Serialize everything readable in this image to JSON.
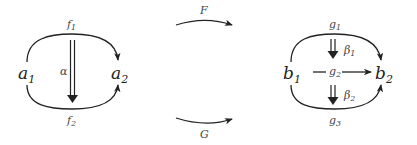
{
  "diagram": {
    "left": {
      "source": {
        "base": "a",
        "sub": "1"
      },
      "target": {
        "base": "a",
        "sub": "2"
      },
      "top_arrow": {
        "base": "f",
        "sub": "1"
      },
      "bottom_arrow": {
        "base": "f",
        "sub": "2"
      },
      "two_cell": "α"
    },
    "middle": {
      "top_functor": "F",
      "bottom_functor": "G"
    },
    "right": {
      "source": {
        "base": "b",
        "sub": "1"
      },
      "target": {
        "base": "b",
        "sub": "2"
      },
      "top_arrow": {
        "base": "g",
        "sub": "1"
      },
      "middle_arrow": {
        "base": "g",
        "sub": "2"
      },
      "bottom_arrow": {
        "base": "g",
        "sub": "3"
      },
      "upper_two_cell": {
        "base": "β",
        "sub": "1"
      },
      "lower_two_cell": {
        "base": "β",
        "sub": "2"
      }
    },
    "colors": {
      "stroke": "#222222",
      "background": "#ffffff"
    }
  }
}
